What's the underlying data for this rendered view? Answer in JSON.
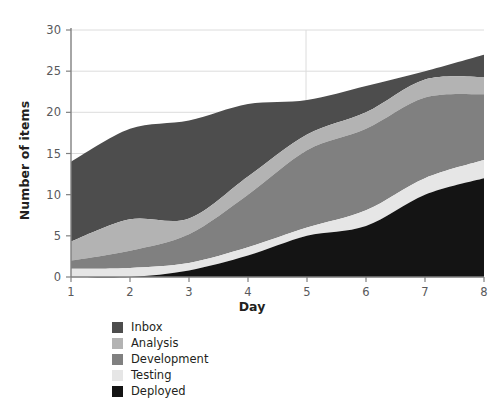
{
  "chart_data": {
    "type": "area",
    "stacked": true,
    "title": "",
    "xlabel": "Day",
    "ylabel": "Number of items",
    "x": [
      1,
      2,
      3,
      4,
      5,
      6,
      7,
      8
    ],
    "xticklabels": [
      "1",
      "2",
      "3",
      "4",
      "5",
      "6",
      "7",
      "8"
    ],
    "yticklabels": [
      "0",
      "5",
      "10",
      "15",
      "20",
      "25",
      "30"
    ],
    "yticks": [
      0,
      5,
      10,
      15,
      20,
      25,
      30
    ],
    "xlim": [
      1,
      8
    ],
    "ylim": [
      0,
      30
    ],
    "grid": "horizontal",
    "legend_position": "below-axes-left",
    "stack_order_bottom_to_top": [
      "Deployed",
      "Testing",
      "Development",
      "Analysis",
      "Inbox"
    ],
    "series": [
      {
        "name": "Inbox",
        "color": "#4d4d4d",
        "values": [
          9.7,
          11.0,
          11.9,
          8.8,
          4.2,
          3.2,
          1.0,
          2.7
        ],
        "cumulative_top": [
          14.0,
          18.0,
          19.0,
          21.0,
          21.5,
          23.2,
          25.0,
          27.0
        ]
      },
      {
        "name": "Analysis",
        "color": "#b3b3b3",
        "values": [
          2.3,
          3.8,
          1.9,
          2.2,
          1.9,
          2.0,
          2.2,
          2.1
        ],
        "cumulative_top": [
          4.3,
          7.0,
          7.1,
          12.2,
          17.3,
          20.0,
          24.0,
          24.3
        ]
      },
      {
        "name": "Development",
        "color": "#808080",
        "values": [
          1.0,
          2.1,
          3.5,
          6.4,
          9.4,
          9.9,
          9.8,
          8.0
        ],
        "cumulative_top": [
          2.0,
          3.2,
          5.2,
          10.0,
          15.4,
          18.0,
          21.8,
          22.2
        ]
      },
      {
        "name": "Testing",
        "color": "#e6e6e6",
        "values": [
          1.0,
          1.1,
          0.9,
          1.0,
          1.0,
          1.9,
          2.0,
          2.2
        ],
        "cumulative_top": [
          1.0,
          1.1,
          1.7,
          3.6,
          6.0,
          8.1,
          12.0,
          14.2
        ]
      },
      {
        "name": "Deployed",
        "color": "#141414",
        "values": [
          0.0,
          0.0,
          0.8,
          2.6,
          5.0,
          6.2,
          10.0,
          12.0
        ],
        "cumulative_top": [
          0.0,
          0.0,
          0.8,
          2.6,
          5.0,
          6.2,
          10.0,
          12.0
        ]
      }
    ]
  },
  "axes": {
    "y_label": "Number of items",
    "x_label": "Day",
    "y_ticks": [
      "30",
      "25",
      "20",
      "15",
      "10",
      "5",
      "0"
    ],
    "x_ticks": [
      "1",
      "2",
      "3",
      "4",
      "5",
      "6",
      "7",
      "8"
    ]
  },
  "legend": {
    "items": [
      {
        "label": "Inbox",
        "color": "#4d4d4d"
      },
      {
        "label": "Analysis",
        "color": "#b3b3b3"
      },
      {
        "label": "Development",
        "color": "#808080"
      },
      {
        "label": "Testing",
        "color": "#e6e6e6"
      },
      {
        "label": "Deployed",
        "color": "#141414"
      }
    ]
  },
  "style": {
    "axis_color": "#808080",
    "grid_color": "#dcdcdc",
    "tick_text_color": "#58595b",
    "label_text_color": "#231f20",
    "background": "#ffffff"
  }
}
